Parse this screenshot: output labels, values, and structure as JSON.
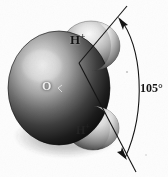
{
  "figure": {
    "background_color": "#fdfdfd",
    "width": 168,
    "height": 177
  },
  "labels": {
    "oxygen": "O",
    "hydrogen_top_base": "H",
    "hydrogen_top_charge": "+",
    "hydrogen_bottom_base": "H",
    "hydrogen_bottom_charge": "+",
    "bond_angle": "105°"
  },
  "atoms": [
    {
      "name": "oxygen",
      "element_label": "O",
      "color": "#1d1d1d",
      "highlight_color": "#d8d8d8",
      "center_x": 60,
      "center_y": 88,
      "radius_x": 50,
      "radius_y": 56
    },
    {
      "name": "hydrogen-top",
      "element_label": "H+",
      "color": "#6a6a6a",
      "highlight_color": "#eeeeee",
      "center_x": 91,
      "center_y": 46,
      "radius_x": 29,
      "radius_y": 25
    },
    {
      "name": "hydrogen-bottom",
      "element_label": "H+",
      "color": "#6f6f6f",
      "highlight_color": "#e6e6e6",
      "center_x": 93,
      "center_y": 128,
      "radius_x": 26,
      "radius_y": 22
    }
  ],
  "annotation": {
    "vertex_x": 79,
    "vertex_y": 63,
    "bond_angle_value": "105°",
    "arc_color": "#141414",
    "line_color": "#141414",
    "arrow_top": "arrowhead pointing up-left",
    "arrow_bottom": "arrowhead pointing down-right"
  },
  "colors": {
    "ink": "#141414",
    "paper": "#fdfdfd",
    "oxygen_dark": "#141414",
    "oxygen_light": "#cfcfcf",
    "hydrogen_light": "#f0f0f0"
  }
}
